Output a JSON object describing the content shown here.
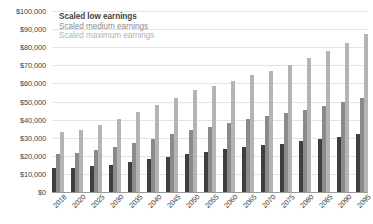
{
  "chart_data": {
    "type": "bar",
    "title": "",
    "xlabel": "",
    "ylabel": "",
    "ylim": [
      0,
      100000
    ],
    "grid": true,
    "legend_position": "top-left",
    "y_ticks": [
      "$0",
      "$10,000",
      "$20,000",
      "$30,000",
      "$40,000",
      "$50,000",
      "$60,000",
      "$70,000",
      "$80,000",
      "$90,000",
      "$100,000"
    ],
    "y_tick_values": [
      0,
      10000,
      20000,
      30000,
      40000,
      50000,
      60000,
      70000,
      80000,
      90000,
      100000
    ],
    "categories": [
      "2018",
      "2020",
      "2025",
      "2030",
      "2035",
      "2040",
      "2045",
      "2050",
      "2055",
      "2060",
      "2065",
      "2070",
      "2075",
      "2080",
      "2085",
      "2090",
      "2095"
    ],
    "series": [
      {
        "name": "Scaled low earnings",
        "color": "#3f3f3f",
        "values": [
          13000,
          13400,
          14200,
          15200,
          16600,
          18100,
          19600,
          21000,
          22200,
          23600,
          24800,
          25800,
          26800,
          28000,
          29200,
          30600,
          32000
        ]
      },
      {
        "name": "Scaled medium earnings",
        "color": "#8a8a8a",
        "values": [
          20800,
          21600,
          23000,
          24800,
          27000,
          29400,
          31800,
          34000,
          36000,
          38200,
          40200,
          42000,
          43600,
          45400,
          47400,
          49600,
          52000
        ]
      },
      {
        "name": "Scaled maximum earnings",
        "color": "#b4b4b4",
        "values": [
          33000,
          34400,
          36800,
          40200,
          44200,
          48200,
          52200,
          56200,
          58600,
          61600,
          64400,
          67000,
          70400,
          74200,
          77800,
          82400,
          87400
        ]
      }
    ]
  },
  "legend": {
    "items": [
      {
        "label": "Scaled low earnings"
      },
      {
        "label": "Scaled medium earnings"
      },
      {
        "label": "Scaled maximum earnings"
      }
    ]
  }
}
